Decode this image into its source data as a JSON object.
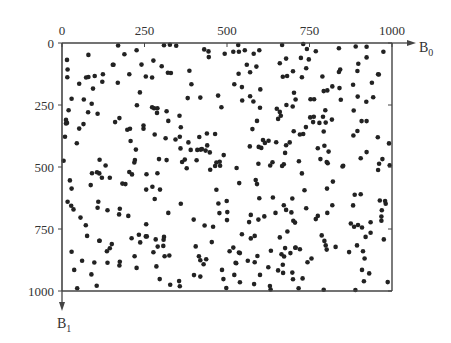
{
  "chart_data": {
    "type": "scatter",
    "title": "",
    "xlabel": "B0",
    "ylabel": "B1",
    "x_axis_position": "top",
    "y_axis_inverted": true,
    "xlim": [
      0,
      1000
    ],
    "ylim": [
      0,
      1000
    ],
    "x_ticks": [
      0,
      250,
      500,
      750,
      1000
    ],
    "y_ticks": [
      0,
      250,
      500,
      750,
      1000
    ],
    "grid": false,
    "legend": null,
    "point_color": "#222222",
    "note": "Approximately 400 random points uniformly distributed over [0,1000]x[0,1000]; these are approximate positions with similar density, not an exact transcription of each dot.",
    "points": []
  },
  "axes": {
    "x_label_main": "B",
    "x_label_sub": "0",
    "y_label_main": "B",
    "y_label_sub": "1",
    "x_tick_labels": [
      "0",
      "250",
      "500",
      "750",
      "1000"
    ],
    "y_tick_labels": [
      "0",
      "250",
      "500",
      "750",
      "1000"
    ]
  }
}
